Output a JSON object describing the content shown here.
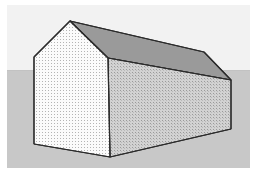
{
  "figure": {
    "title": "Gabled building in three-point perspective",
    "canvas": {
      "width": 257,
      "height": 176
    },
    "frame": {
      "x": 7,
      "y": 5,
      "width": 243,
      "height": 163
    }
  },
  "background": {
    "sky": {
      "label": "sky",
      "color": "#f2f2f2",
      "region": {
        "x": 7,
        "y": 5,
        "width": 243,
        "height": 65
      }
    },
    "ground": {
      "label": "ground",
      "color": "#c8c8c8",
      "region": {
        "x": 7,
        "y": 70,
        "width": 243,
        "height": 98
      }
    },
    "horizon": {
      "label": "horizon line",
      "y": 70,
      "color": "#c8c8c8"
    }
  },
  "building": {
    "name": "gabled-building",
    "outline_color": "#2b2b2b",
    "outline_width": 1.1,
    "vertices": {
      "ridge_front": [
        70,
        21
      ],
      "ridge_back": [
        204,
        52
      ],
      "eave_front_left": [
        34,
        57
      ],
      "eave_front_right": [
        108,
        58
      ],
      "eave_back_right": [
        231,
        80
      ],
      "base_front_left": [
        34,
        144
      ],
      "base_front_right": [
        110,
        157
      ],
      "base_back_right": [
        231,
        129
      ]
    },
    "faces": [
      {
        "id": "gable-wall",
        "label": "Front gable end wall",
        "fill": "#fbfbfb",
        "texture": "fine-dot-stipple",
        "texture_color": "#b4b4b4",
        "points": "70,21 108,58 110,157 34,144 34,57"
      },
      {
        "id": "side-wall",
        "label": "Long side wall",
        "fill": "#d2d2d2",
        "texture": "fine-dot-stipple",
        "texture_color": "#9a9a9a",
        "points": "108,58 231,80 231,129 110,157"
      },
      {
        "id": "roof-plane",
        "label": "Roof slope",
        "fill": "#9a9a9a",
        "texture": "solid",
        "texture_color": "#9a9a9a",
        "points": "70,21 204,52 231,80 108,58"
      }
    ],
    "edges": [
      {
        "id": "ridge-line",
        "label": "Roof ridge",
        "from": "ridge_front",
        "to": "ridge_back"
      },
      {
        "id": "hip-edge",
        "label": "Back roof edge",
        "from": "ridge_back",
        "to": "eave_back_right"
      },
      {
        "id": "eave-line",
        "label": "Near eave line",
        "from": "eave_front_right",
        "to": "eave_back_right"
      },
      {
        "id": "gable-left-rake",
        "label": "Left rake",
        "from": "ridge_front",
        "to": "eave_front_left"
      },
      {
        "id": "gable-right-rake",
        "label": "Right rake",
        "from": "ridge_front",
        "to": "eave_front_right"
      },
      {
        "id": "corner-near",
        "label": "Near vertical corner",
        "from": "eave_front_right",
        "to": "base_front_right"
      },
      {
        "id": "corner-left",
        "label": "Left vertical corner",
        "from": "eave_front_left",
        "to": "base_front_left"
      },
      {
        "id": "corner-far",
        "label": "Far vertical corner",
        "from": "eave_back_right",
        "to": "base_back_right"
      },
      {
        "id": "base-front",
        "label": "Front base line",
        "from": "base_front_left",
        "to": "base_front_right"
      },
      {
        "id": "base-side",
        "label": "Side base line",
        "from": "base_front_right",
        "to": "base_back_right"
      }
    ]
  }
}
